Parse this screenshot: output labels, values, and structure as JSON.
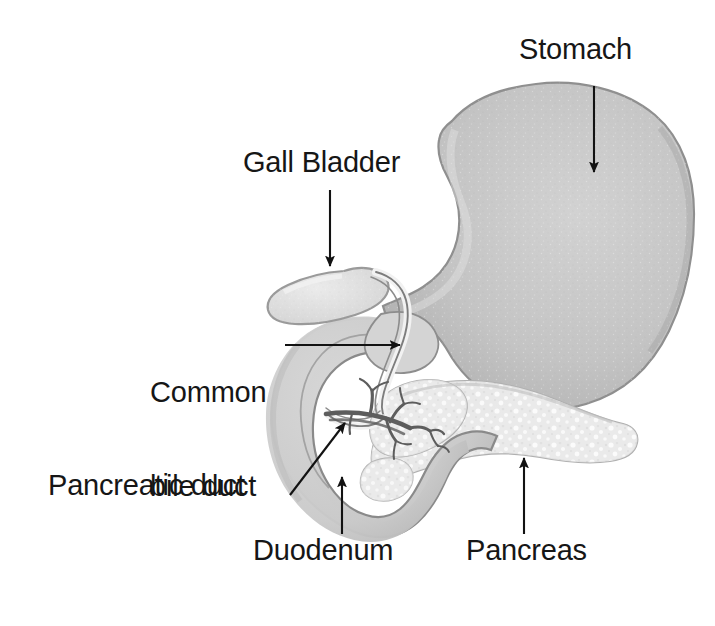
{
  "figure": {
    "background_color": "#ffffff",
    "text_color": "#161616",
    "width": 715,
    "height": 626
  },
  "labels": {
    "stomach": "Stomach",
    "gall_bladder": "Gall Bladder",
    "common_bile_duct_line1": "Common",
    "common_bile_duct_line2": "bile duct",
    "pancreatic_duct": "Pancreatic duct",
    "duodenum": "Duodenum",
    "pancreas": "Pancreas"
  },
  "structures": [
    {
      "name": "stomach",
      "label": "Stomach",
      "fill_color": "#c2c2c2",
      "outline_color": "#8f8f8f",
      "description": "Large J-shaped organ occupying the upper right of the figure"
    },
    {
      "name": "gall-bladder",
      "label": "Gall Bladder",
      "fill_color": "#e0e0e0",
      "outline_color": "#9a9a9a",
      "description": "Small pear-shaped sac above and left of the duodenum"
    },
    {
      "name": "common-bile-duct",
      "label": "Common bile duct",
      "fill_color": "#f0f0f0",
      "outline_color": "#7d7d7d",
      "description": "Tube descending from the gall bladder into the duodenum"
    },
    {
      "name": "pancreatic-duct",
      "label": "Pancreatic duct",
      "fill_color": "none",
      "outline_color": "#5a5a5a",
      "description": "Branching duct tree inside the head of the pancreas"
    },
    {
      "name": "duodenum",
      "label": "Duodenum",
      "fill_color": "#cfcfcf",
      "outline_color": "#8a8a8a",
      "description": "C-shaped first part of small intestine curving around the pancreas head"
    },
    {
      "name": "pancreas",
      "label": "Pancreas",
      "fill_color": "#ebebeb",
      "outline_color": "#a8a8a8",
      "description": "Elongated stippled gland extending to the right"
    }
  ],
  "annotations": [
    {
      "name": "stomach-arrow",
      "target": "stomach",
      "direction": "down",
      "from": [
        594,
        86
      ],
      "to": [
        594,
        172
      ]
    },
    {
      "name": "gall-bladder-arrow",
      "target": "gall-bladder",
      "direction": "down",
      "from": [
        330,
        190
      ],
      "to": [
        330,
        266
      ]
    },
    {
      "name": "common-bile-duct-arrow",
      "target": "common-bile-duct",
      "direction": "right",
      "from": [
        285,
        345
      ],
      "to": [
        400,
        345
      ]
    },
    {
      "name": "pancreatic-duct-arrow",
      "target": "pancreatic-duct",
      "direction": "up-right",
      "from": [
        290,
        495
      ],
      "to": [
        345,
        423
      ]
    },
    {
      "name": "duodenum-arrow",
      "target": "duodenum",
      "direction": "up",
      "from": [
        342,
        534
      ],
      "to": [
        342,
        477
      ]
    },
    {
      "name": "pancreas-arrow",
      "target": "pancreas",
      "direction": "up",
      "from": [
        524,
        534
      ],
      "to": [
        524,
        458
      ]
    }
  ]
}
